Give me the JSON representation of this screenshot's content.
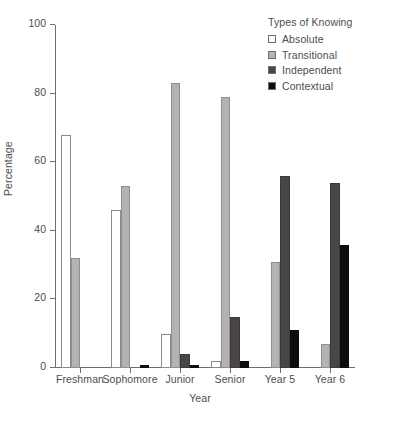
{
  "chart_data": {
    "type": "bar",
    "title": "",
    "xlabel": "Year",
    "ylabel": "Percentage",
    "ylim": [
      0,
      100
    ],
    "yticks": [
      0,
      20,
      40,
      60,
      80,
      100
    ],
    "grid": false,
    "legend_position": "top-right",
    "legend_title": "Types of Knowing",
    "categories": [
      "Freshman",
      "Sophomore",
      "Junior",
      "Senior",
      "Year 5",
      "Year 6"
    ],
    "series": [
      {
        "name": "Absolute",
        "color": "#ffffff",
        "values": [
          68,
          46,
          10,
          2,
          0,
          0
        ]
      },
      {
        "name": "Transitional",
        "color": "#b3b3b3",
        "values": [
          32,
          53,
          83,
          79,
          31,
          7
        ]
      },
      {
        "name": "Independent",
        "color": "#4a4547",
        "values": [
          0,
          0,
          4,
          15,
          56,
          54
        ]
      },
      {
        "name": "Contextual",
        "color": "#0d0d0d",
        "values": [
          0,
          1,
          1,
          2,
          11,
          36
        ]
      }
    ]
  },
  "axis": {
    "y_tick_labels": [
      "0",
      "20",
      "40",
      "60",
      "80",
      "100"
    ],
    "x_tick_labels": [
      "Freshman",
      "Sophomore",
      "Junior",
      "Senior",
      "Year 5",
      "Year 6"
    ],
    "x_title": "Year",
    "y_title": "Percentage"
  },
  "legend": {
    "title": "Types of Knowing",
    "items": [
      {
        "label": "Absolute",
        "swatch": "absolute"
      },
      {
        "label": "Transitional",
        "swatch": "transitional"
      },
      {
        "label": "Independent",
        "swatch": "independent"
      },
      {
        "label": "Contextual",
        "swatch": "contextual"
      }
    ]
  },
  "colors": {
    "absolute": "#ffffff",
    "transitional": "#b3b3b3",
    "independent": "#4a4547",
    "contextual": "#0d0d0d",
    "axis": "#6e6e70",
    "text": "#4d4d4f"
  }
}
